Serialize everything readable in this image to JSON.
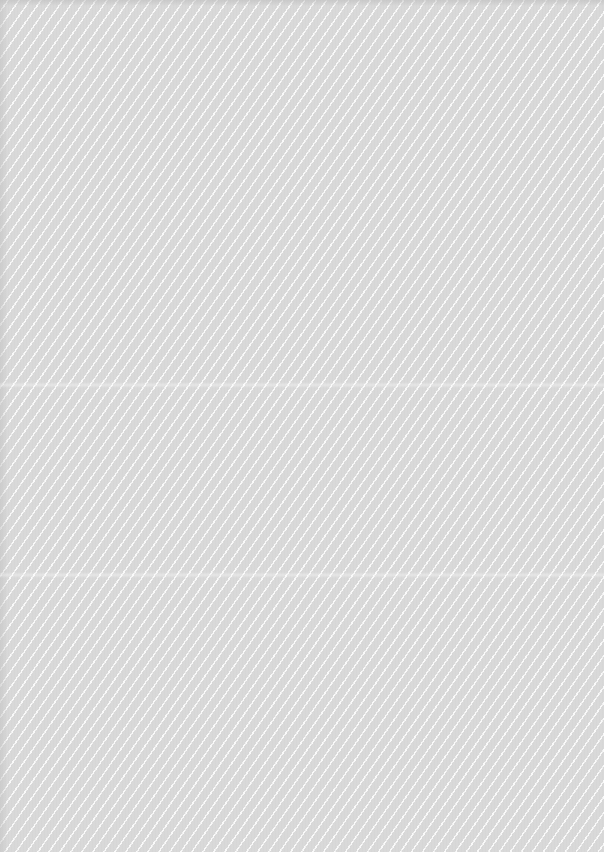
{
  "surface": {
    "background_color": "#d9d9d9",
    "stripe_color": "#ffffff",
    "texture": "diagonal-stripes",
    "stripe_direction": "lower-left to upper-right"
  },
  "creases": [
    {
      "y": 385
    },
    {
      "y": 575
    }
  ]
}
